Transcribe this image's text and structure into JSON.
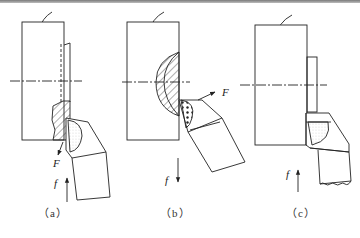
{
  "figure": {
    "panels": [
      {
        "id": "a",
        "label": "（a）",
        "force_label": "F",
        "feed_label": "f",
        "feed_direction": "up"
      },
      {
        "id": "b",
        "label": "（b）",
        "force_label": "F",
        "feed_label": "f",
        "feed_direction": "down"
      },
      {
        "id": "c",
        "label": "（c）",
        "force_label": "",
        "feed_label": "f",
        "feed_direction": "up"
      }
    ]
  },
  "colors": {
    "line": "#222222",
    "top_rule": "#8a8a8a"
  }
}
